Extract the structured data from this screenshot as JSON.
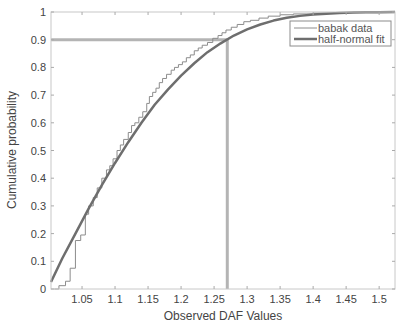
{
  "chart_data": {
    "type": "line",
    "title": "",
    "xlabel": "Observed DAF Values",
    "ylabel": "Cumulative probability",
    "xlim": [
      1.003,
      1.524
    ],
    "ylim": [
      0,
      1
    ],
    "xticks": [
      1.05,
      1.1,
      1.15,
      1.2,
      1.25,
      1.3,
      1.35,
      1.4,
      1.45,
      1.5
    ],
    "xtick_labels": [
      "1.05",
      "1.1",
      "1.15",
      "1.2",
      "1.25",
      "1.3",
      "1.35",
      "1.4",
      "1.45",
      "1.5"
    ],
    "yticks": [
      0,
      0.1,
      0.2,
      0.3,
      0.4,
      0.5,
      0.6,
      0.7,
      0.8,
      0.9,
      1
    ],
    "ytick_labels": [
      "0",
      "0.1",
      "0.2",
      "0.3",
      "0.4",
      "0.5",
      "0.6",
      "0.7",
      "0.8",
      "0.9",
      "1"
    ],
    "grid": false,
    "legend_position": "upper right",
    "series": [
      {
        "name": "babak data",
        "style": "step",
        "color": "#8c8c8c",
        "width": 1,
        "x": [
          1.008,
          1.015,
          1.025,
          1.032,
          1.04,
          1.048,
          1.055,
          1.06,
          1.067,
          1.073,
          1.08,
          1.087,
          1.092,
          1.097,
          1.103,
          1.108,
          1.113,
          1.12,
          1.125,
          1.13,
          1.136,
          1.142,
          1.148,
          1.152,
          1.157,
          1.162,
          1.167,
          1.172,
          1.178,
          1.185,
          1.19,
          1.196,
          1.202,
          1.208,
          1.214,
          1.22,
          1.226,
          1.232,
          1.24,
          1.248,
          1.256,
          1.262,
          1.268,
          1.276,
          1.285,
          1.295,
          1.305,
          1.318,
          1.332,
          1.35,
          1.37,
          1.4,
          1.43,
          1.46,
          1.5,
          1.524
        ],
        "y": [
          0.0,
          0.012,
          0.028,
          0.075,
          0.175,
          0.195,
          0.27,
          0.3,
          0.33,
          0.365,
          0.4,
          0.43,
          0.445,
          0.47,
          0.5,
          0.52,
          0.54,
          0.565,
          0.59,
          0.6,
          0.62,
          0.64,
          0.67,
          0.695,
          0.71,
          0.725,
          0.745,
          0.76,
          0.775,
          0.79,
          0.8,
          0.81,
          0.82,
          0.835,
          0.845,
          0.86,
          0.87,
          0.88,
          0.89,
          0.905,
          0.915,
          0.925,
          0.935,
          0.945,
          0.955,
          0.965,
          0.97,
          0.978,
          0.985,
          0.99,
          0.993,
          0.996,
          0.998,
          0.999,
          1.0,
          1.0
        ]
      },
      {
        "name": "half-normal fit",
        "style": "line",
        "color": "#6e6e6e",
        "width": 2.5,
        "x": [
          1.003,
          1.02,
          1.04,
          1.06,
          1.08,
          1.1,
          1.12,
          1.14,
          1.16,
          1.18,
          1.2,
          1.22,
          1.24,
          1.26,
          1.28,
          1.3,
          1.32,
          1.34,
          1.36,
          1.38,
          1.4,
          1.42,
          1.44,
          1.46,
          1.48,
          1.5,
          1.524
        ],
        "y": [
          0.025,
          0.11,
          0.2,
          0.29,
          0.375,
          0.455,
          0.53,
          0.6,
          0.665,
          0.72,
          0.77,
          0.815,
          0.855,
          0.887,
          0.915,
          0.937,
          0.955,
          0.969,
          0.979,
          0.986,
          0.991,
          0.994,
          0.996,
          0.998,
          0.999,
          0.9995,
          1.0
        ]
      }
    ],
    "annotations": [
      {
        "type": "hline",
        "y": 0.9,
        "x_from": 1.003,
        "x_to": 1.27,
        "color": "#b4b4b4",
        "width": 3
      },
      {
        "type": "vline",
        "x": 1.27,
        "y_from": 0,
        "y_to": 0.9,
        "color": "#b4b4b4",
        "width": 3
      }
    ]
  },
  "legend": {
    "items": [
      {
        "label": "babak data"
      },
      {
        "label": "half-normal fit"
      }
    ]
  }
}
